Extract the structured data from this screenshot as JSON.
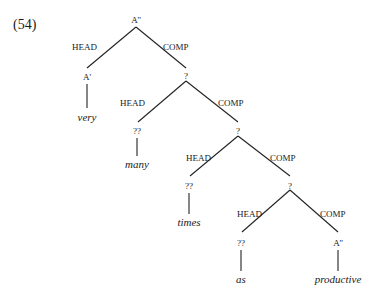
{
  "example": {
    "number": "(54)"
  },
  "tree": {
    "root": "A''",
    "edge_labels": {
      "head": "HEAD",
      "comp": "COMP"
    },
    "nodes": {
      "n1": "A'",
      "n2": "?",
      "n3": "??",
      "n4": "?",
      "n5": "??",
      "n6": "?",
      "n7": "??",
      "n8": "A''"
    },
    "leaves": {
      "w1": "very",
      "w2": "many",
      "w3": "times",
      "w4": "as",
      "w5": "productive"
    }
  }
}
